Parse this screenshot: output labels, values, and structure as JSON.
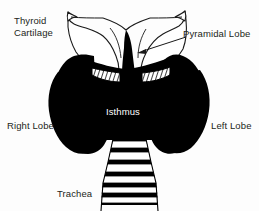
{
  "figure": {
    "background_color": "#fdfdfd",
    "ink_color": "#000000",
    "label_color": "#231f20",
    "inverse_label_color": "#ffffff"
  },
  "labels": {
    "thyroid_cartilage_line1": "Thyroid",
    "thyroid_cartilage_line2": "Cartilage",
    "pyramidal_lobe": "Pyramidal Lobe",
    "right_lobe": "Right Lobe",
    "left_lobe": "Left Lobe",
    "isthmus": "Isthmus",
    "trachea": "Trachea"
  },
  "structures": [
    {
      "name": "thyroid-cartilage",
      "description": "White outlined shield-shaped cartilage with two superior horns and a central notch",
      "fill": "#ffffff",
      "stroke": "#1a1a1a"
    },
    {
      "name": "thyroid-gland",
      "description": "Solid black butterfly-shaped gland with right lobe, left lobe and isthmus",
      "fill": "#000000"
    },
    {
      "name": "pyramidal-lobe",
      "description": "Narrow black spike projecting superiorly from the isthmus",
      "fill": "#000000"
    },
    {
      "name": "cricothyroid-hatching",
      "description": "Two hatched triangular membrane areas flanking the pyramidal lobe",
      "fill": "#ffffff",
      "stroke": "#000000"
    },
    {
      "name": "trachea",
      "description": "Stack of white cartilage rings separated by black, widening inferiorly",
      "rings": 7,
      "fill": "#ffffff",
      "stroke": "#000000"
    }
  ],
  "leader_lines": [
    {
      "name": "pyramidal-lobe-pointer",
      "from": "Pyramidal Lobe label",
      "to": "pyramidal lobe apex",
      "has_arrowhead": true,
      "stroke": "#1a1a1a"
    }
  ]
}
